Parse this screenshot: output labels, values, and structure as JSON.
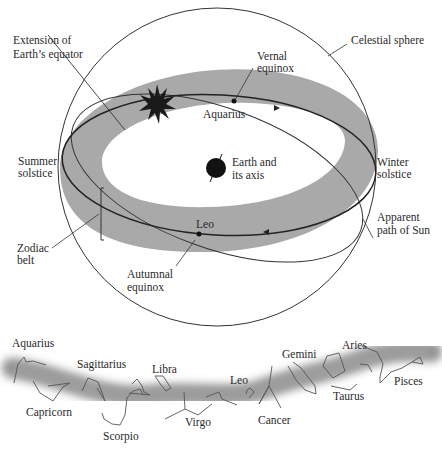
{
  "figure": {
    "top_diagram": {
      "labels": {
        "extension_equator": [
          "Extension of",
          "Earth’s equator"
        ],
        "vernal_equinox": [
          "Vernal",
          "equinox"
        ],
        "celestial_sphere": "Celestial sphere",
        "aquarius": "Aquarius",
        "summer_solstice": [
          "Summer",
          "solstice"
        ],
        "earth_axis": [
          "Earth and",
          "its axis"
        ],
        "winter_solstice": [
          "Winter",
          "solstice"
        ],
        "zodiac_belt": [
          "Zodiac",
          "belt"
        ],
        "leo": "Leo",
        "apparent_path": [
          "Apparent",
          "path of Sun"
        ],
        "autumnal_equinox": [
          "Autumnal",
          "equinox"
        ]
      },
      "colors": {
        "belt": "#a9a9a9",
        "line": "#333333",
        "sun": "#1a1a1a"
      }
    },
    "zodiac_strip": {
      "constellations": [
        "Aquarius",
        "Capricorn",
        "Sagittarius",
        "Scorpio",
        "Libra",
        "Virgo",
        "Leo",
        "Cancer",
        "Gemini",
        "Taurus",
        "Aries",
        "Pisces"
      ]
    }
  }
}
